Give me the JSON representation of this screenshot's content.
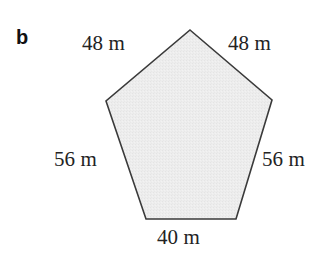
{
  "figure": {
    "part_label": "b",
    "shape_name": "pentagon",
    "fill_color": "#ececec",
    "stroke_color": "#3a3a3a",
    "background_color": "#ffffff",
    "unit": "m",
    "vertices": [
      [
        190,
        30
      ],
      [
        272,
        100
      ],
      [
        236,
        219
      ],
      [
        146,
        219
      ],
      [
        106,
        101
      ]
    ],
    "labels": {
      "top_left": "48 m",
      "top_right": "48 m",
      "left": "56 m",
      "right": "56 m",
      "bottom": "40 m"
    }
  },
  "chart_data": {
    "type": "diagram",
    "title": "",
    "shape": "pentagon",
    "side_count": 5,
    "unit": "m",
    "sides": [
      {
        "name": "top-left",
        "length": 48,
        "label": "48 m"
      },
      {
        "name": "top-right",
        "length": 48,
        "label": "48 m"
      },
      {
        "name": "right",
        "length": 56,
        "label": "56 m"
      },
      {
        "name": "bottom",
        "length": 40,
        "label": "40 m"
      },
      {
        "name": "left",
        "length": 56,
        "label": "56 m"
      }
    ],
    "perimeter": 248
  }
}
